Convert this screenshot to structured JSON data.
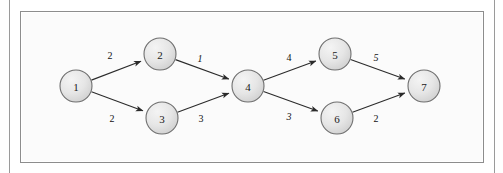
{
  "figure": {
    "type": "directed-weighted-graph",
    "background_color": "#fbfbfb",
    "frame_color": "#8d8d8d",
    "node_fill": "#e3e3e3",
    "node_stroke": "#6f6f6f",
    "edge_color": "#2b2b2b",
    "nodes": [
      {
        "id": "1",
        "label": "1",
        "cx": 76,
        "cy": 86,
        "r": 16
      },
      {
        "id": "2",
        "label": "2",
        "cx": 160,
        "cy": 54,
        "r": 16
      },
      {
        "id": "3",
        "label": "3",
        "cx": 162,
        "cy": 118,
        "r": 16
      },
      {
        "id": "4",
        "label": "4",
        "cx": 248,
        "cy": 86,
        "r": 16
      },
      {
        "id": "5",
        "label": "5",
        "cx": 335,
        "cy": 54,
        "r": 16
      },
      {
        "id": "6",
        "label": "6",
        "cx": 337,
        "cy": 118,
        "r": 16
      },
      {
        "id": "7",
        "label": "7",
        "cx": 424,
        "cy": 86,
        "r": 16
      }
    ],
    "edges": [
      {
        "from": "1",
        "to": "2",
        "weight": "2",
        "italic": false,
        "lx": 110,
        "ly": 55
      },
      {
        "from": "1",
        "to": "3",
        "weight": "2",
        "italic": false,
        "lx": 112,
        "ly": 118
      },
      {
        "from": "2",
        "to": "4",
        "weight": "1",
        "italic": true,
        "lx": 200,
        "ly": 58
      },
      {
        "from": "3",
        "to": "4",
        "weight": "3",
        "italic": false,
        "lx": 201,
        "ly": 118
      },
      {
        "from": "4",
        "to": "5",
        "weight": "4",
        "italic": false,
        "lx": 289,
        "ly": 57
      },
      {
        "from": "4",
        "to": "6",
        "weight": "3",
        "italic": true,
        "lx": 289,
        "ly": 116
      },
      {
        "from": "5",
        "to": "7",
        "weight": "5",
        "italic": true,
        "lx": 376,
        "ly": 57
      },
      {
        "from": "6",
        "to": "7",
        "weight": "2",
        "italic": false,
        "lx": 376,
        "ly": 118
      }
    ]
  }
}
